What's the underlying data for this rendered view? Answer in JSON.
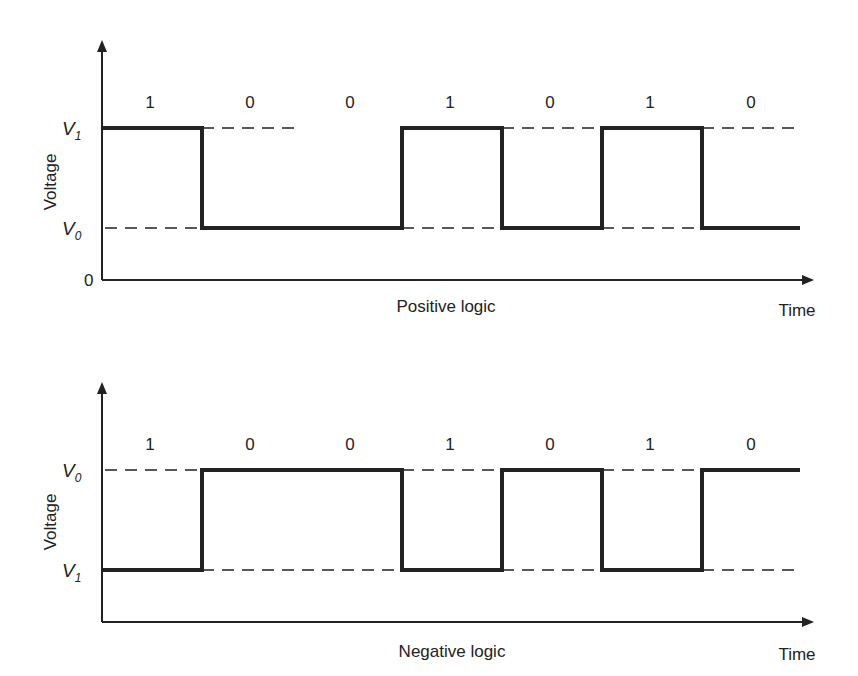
{
  "diagram": {
    "top": {
      "title": "Positive logic",
      "ylabel": "Voltage",
      "xlabel": "Time",
      "levels": {
        "upper": "V",
        "upper_sub": "1",
        "lower": "V",
        "lower_sub": "0",
        "zero": "0"
      },
      "bits": [
        "1",
        "0",
        "0",
        "1",
        "0",
        "1",
        "0"
      ]
    },
    "bottom": {
      "title": "Negative logic",
      "ylabel": "Voltage",
      "xlabel": "Time",
      "levels": {
        "upper": "V",
        "upper_sub": "0",
        "lower": "V",
        "lower_sub": "1"
      },
      "bits": [
        "1",
        "0",
        "0",
        "1",
        "0",
        "1",
        "0"
      ]
    }
  }
}
